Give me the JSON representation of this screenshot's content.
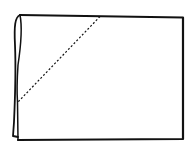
{
  "diagram": {
    "type": "paper-fold-illustration",
    "colors": {
      "stroke": "#111111",
      "background": "#ffffff"
    },
    "sheet": {
      "top_left": [
        20,
        15
      ],
      "top_right": [
        183,
        17
      ],
      "bottom_right": [
        183,
        139
      ],
      "bottom_left": [
        18,
        140
      ]
    },
    "fold_line": {
      "style": "dashed",
      "start": [
        100,
        16
      ],
      "end": [
        18,
        102
      ]
    }
  }
}
